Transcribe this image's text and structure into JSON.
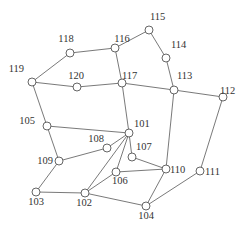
{
  "diagram": {
    "type": "network-graph",
    "nodes": [
      {
        "id": "101",
        "x": 129,
        "y": 133,
        "lx": 134,
        "ly": 127,
        "anchor": "start"
      },
      {
        "id": "102",
        "x": 85,
        "y": 193,
        "lx": 84,
        "ly": 206,
        "anchor": "middle"
      },
      {
        "id": "103",
        "x": 36,
        "y": 192,
        "lx": 36,
        "ly": 205,
        "anchor": "middle"
      },
      {
        "id": "104",
        "x": 146,
        "y": 206,
        "lx": 146,
        "ly": 219,
        "anchor": "middle"
      },
      {
        "id": "105",
        "x": 47,
        "y": 126,
        "lx": 35,
        "ly": 124,
        "anchor": "end"
      },
      {
        "id": "106",
        "x": 116,
        "y": 172,
        "lx": 112,
        "ly": 184,
        "anchor": "start"
      },
      {
        "id": "107",
        "x": 132,
        "y": 157,
        "lx": 136,
        "ly": 150,
        "anchor": "start"
      },
      {
        "id": "108",
        "x": 107,
        "y": 148,
        "lx": 104,
        "ly": 142,
        "anchor": "end"
      },
      {
        "id": "109",
        "x": 59,
        "y": 161,
        "lx": 53,
        "ly": 164,
        "anchor": "end"
      },
      {
        "id": "110",
        "x": 166,
        "y": 169,
        "lx": 170,
        "ly": 173,
        "anchor": "start"
      },
      {
        "id": "111",
        "x": 200,
        "y": 171,
        "lx": 205,
        "ly": 175,
        "anchor": "start"
      },
      {
        "id": "112",
        "x": 223,
        "y": 97,
        "lx": 220,
        "ly": 94,
        "anchor": "start"
      },
      {
        "id": "113",
        "x": 174,
        "y": 90,
        "lx": 177,
        "ly": 79,
        "anchor": "start"
      },
      {
        "id": "114",
        "x": 166,
        "y": 58,
        "lx": 171,
        "ly": 48,
        "anchor": "start"
      },
      {
        "id": "115",
        "x": 149,
        "y": 30,
        "lx": 150,
        "ly": 20,
        "anchor": "start"
      },
      {
        "id": "116",
        "x": 115,
        "y": 48,
        "lx": 122,
        "ly": 42,
        "anchor": "middle"
      },
      {
        "id": "117",
        "x": 122,
        "y": 83,
        "lx": 122,
        "ly": 79,
        "anchor": "start"
      },
      {
        "id": "118",
        "x": 70,
        "y": 53,
        "lx": 66,
        "ly": 42,
        "anchor": "middle"
      },
      {
        "id": "119",
        "x": 32,
        "y": 82,
        "lx": 24,
        "ly": 72,
        "anchor": "end"
      },
      {
        "id": "120",
        "x": 77,
        "y": 87,
        "lx": 76,
        "ly": 79,
        "anchor": "middle"
      }
    ],
    "edges": [
      [
        "118",
        "116"
      ],
      [
        "118",
        "119"
      ],
      [
        "116",
        "115"
      ],
      [
        "116",
        "117"
      ],
      [
        "115",
        "114"
      ],
      [
        "114",
        "113"
      ],
      [
        "119",
        "120"
      ],
      [
        "120",
        "117"
      ],
      [
        "117",
        "113"
      ],
      [
        "113",
        "112"
      ],
      [
        "119",
        "105"
      ],
      [
        "117",
        "101"
      ],
      [
        "113",
        "110"
      ],
      [
        "112",
        "111"
      ],
      [
        "105",
        "101"
      ],
      [
        "105",
        "109"
      ],
      [
        "108",
        "109"
      ],
      [
        "108",
        "101"
      ],
      [
        "109",
        "103"
      ],
      [
        "103",
        "102"
      ],
      [
        "102",
        "101"
      ],
      [
        "102",
        "106"
      ],
      [
        "106",
        "101"
      ],
      [
        "102",
        "104"
      ],
      [
        "106",
        "110"
      ],
      [
        "107",
        "101"
      ],
      [
        "107",
        "110"
      ],
      [
        "110",
        "104"
      ],
      [
        "111",
        "104"
      ]
    ],
    "colors": {
      "edge": "#6a6a6a",
      "node_stroke": "#555555",
      "node_fill": "#ffffff",
      "label": "#333333"
    },
    "node_radius": 4
  }
}
